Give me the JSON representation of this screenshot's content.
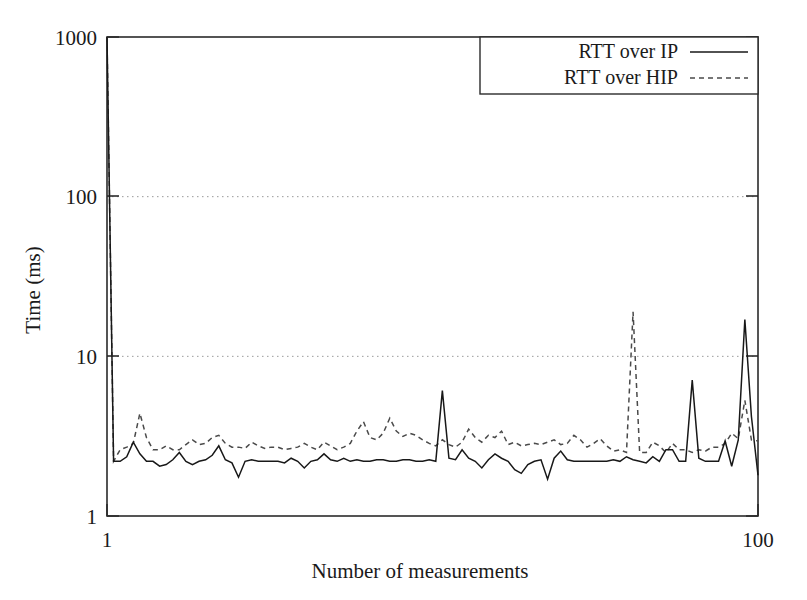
{
  "chart_data": {
    "type": "line",
    "title": "",
    "xlabel": "Number of measurements",
    "ylabel": "Time (ms)",
    "xscale": "linear",
    "yscale": "log",
    "xlim": [
      1,
      100
    ],
    "ylim": [
      1,
      1000
    ],
    "xticks": [
      1,
      100
    ],
    "xtick_labels": [
      "1",
      "100"
    ],
    "yticks": [
      1,
      10,
      100,
      1000
    ],
    "ytick_labels": [
      "1",
      "10",
      "100",
      "1000"
    ],
    "grid": true,
    "gridlines_at": [
      10,
      100
    ],
    "legend_position": "top-right",
    "legend_boxed": true,
    "x": [
      1,
      2,
      3,
      4,
      5,
      6,
      7,
      8,
      9,
      10,
      11,
      12,
      13,
      14,
      15,
      16,
      17,
      18,
      19,
      20,
      21,
      22,
      23,
      24,
      25,
      26,
      27,
      28,
      29,
      30,
      31,
      32,
      33,
      34,
      35,
      36,
      37,
      38,
      39,
      40,
      41,
      42,
      43,
      44,
      45,
      46,
      47,
      48,
      49,
      50,
      51,
      52,
      53,
      54,
      55,
      56,
      57,
      58,
      59,
      60,
      61,
      62,
      63,
      64,
      65,
      66,
      67,
      68,
      69,
      70,
      71,
      72,
      73,
      74,
      75,
      76,
      77,
      78,
      79,
      80,
      81,
      82,
      83,
      84,
      85,
      86,
      87,
      88,
      89,
      90,
      91,
      92,
      93,
      94,
      95,
      96,
      97,
      98,
      99,
      100
    ],
    "series": [
      {
        "name": "RTT over IP",
        "style": "solid",
        "color": "#181818",
        "values": [
          1000,
          2.2,
          2.2,
          2.35,
          2.9,
          2.45,
          2.2,
          2.2,
          2.05,
          2.1,
          2.25,
          2.5,
          2.2,
          2.1,
          2.2,
          2.25,
          2.4,
          2.75,
          2.25,
          2.15,
          1.75,
          2.2,
          2.25,
          2.2,
          2.2,
          2.2,
          2.2,
          2.15,
          2.3,
          2.2,
          2.0,
          2.2,
          2.25,
          2.45,
          2.25,
          2.2,
          2.3,
          2.2,
          2.25,
          2.2,
          2.2,
          2.25,
          2.25,
          2.2,
          2.2,
          2.25,
          2.25,
          2.2,
          2.2,
          2.25,
          2.2,
          6.1,
          2.3,
          2.25,
          2.6,
          2.3,
          2.2,
          2.0,
          2.25,
          2.45,
          2.3,
          2.2,
          1.95,
          1.85,
          2.1,
          2.2,
          2.25,
          1.7,
          2.3,
          2.55,
          2.25,
          2.2,
          2.2,
          2.2,
          2.2,
          2.2,
          2.2,
          2.25,
          2.2,
          2.35,
          2.25,
          2.2,
          2.15,
          2.35,
          2.2,
          2.6,
          2.6,
          2.2,
          2.2,
          7.1,
          2.3,
          2.2,
          2.2,
          2.2,
          2.95,
          2.05,
          3.0,
          17.0,
          4.2,
          1.8
        ]
      },
      {
        "name": "RTT over HIP",
        "style": "dashed",
        "color": "#4a4a4a",
        "values": [
          1000,
          2.2,
          2.6,
          2.7,
          2.85,
          4.4,
          3.1,
          2.6,
          2.6,
          2.75,
          2.6,
          2.6,
          2.8,
          3.0,
          2.8,
          2.85,
          3.1,
          3.2,
          2.85,
          2.7,
          2.7,
          2.65,
          2.9,
          2.75,
          2.65,
          2.7,
          2.7,
          2.6,
          2.65,
          2.7,
          2.85,
          2.7,
          2.6,
          2.9,
          2.75,
          2.6,
          2.7,
          2.85,
          3.4,
          3.9,
          3.1,
          3.0,
          3.3,
          4.1,
          3.4,
          3.15,
          3.3,
          3.2,
          3.0,
          2.85,
          2.75,
          3.0,
          2.8,
          2.7,
          2.9,
          3.5,
          3.1,
          2.9,
          3.2,
          3.1,
          3.4,
          2.8,
          2.9,
          2.75,
          2.8,
          2.85,
          2.8,
          2.9,
          3.0,
          2.8,
          2.85,
          3.2,
          3.0,
          2.7,
          2.85,
          3.05,
          2.75,
          2.55,
          2.6,
          2.5,
          19.0,
          2.5,
          2.5,
          2.9,
          2.75,
          2.5,
          2.85,
          2.6,
          2.6,
          2.5,
          2.6,
          2.55,
          2.7,
          2.7,
          2.85,
          3.3,
          3.05,
          5.3,
          3.0,
          2.95
        ]
      }
    ],
    "colors": {
      "series_ip": "#181818",
      "series_hip": "#4a4a4a",
      "frame": "#2b2b2b",
      "grid": "#9a9a9a",
      "background": "#ffffff"
    }
  },
  "axes": {
    "y_title": "Time (ms)",
    "x_title": "Number of measurements",
    "y_tick_1000": "1000",
    "y_tick_100": "100",
    "y_tick_10": "10",
    "y_tick_1": "1",
    "x_tick_min": "1",
    "x_tick_max": "100"
  },
  "legend": {
    "entries": [
      {
        "label": "RTT over IP",
        "style": "solid"
      },
      {
        "label": "RTT over HIP",
        "style": "dashed"
      }
    ],
    "entry_0_label": "RTT over IP",
    "entry_1_label": "RTT over HIP"
  }
}
